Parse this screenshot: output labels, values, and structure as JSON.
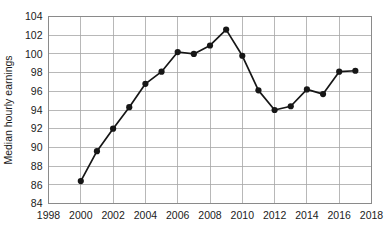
{
  "chart_data": {
    "type": "line",
    "title": "",
    "xlabel": "",
    "ylabel": "Median hourly earnings",
    "xlim": [
      1998,
      2018
    ],
    "ylim": [
      84,
      104
    ],
    "xticks": [
      1998,
      2000,
      2002,
      2004,
      2006,
      2008,
      2010,
      2012,
      2014,
      2016,
      2018
    ],
    "yticks": [
      84,
      86,
      88,
      90,
      92,
      94,
      96,
      98,
      100,
      102,
      104
    ],
    "grid": true,
    "legend": "none",
    "x": [
      2000,
      2001,
      2002,
      2003,
      2004,
      2005,
      2006,
      2007,
      2008,
      2009,
      2010,
      2011,
      2012,
      2013,
      2014,
      2015,
      2016,
      2017
    ],
    "values": [
      86.4,
      89.6,
      92.0,
      94.3,
      96.8,
      98.1,
      100.2,
      100.0,
      100.9,
      102.6,
      99.8,
      96.1,
      94.0,
      94.4,
      96.2,
      95.7,
      98.1,
      98.2
    ],
    "series": [
      {
        "name": "Median hourly earnings",
        "values": [
          86.4,
          89.6,
          92.0,
          94.3,
          96.8,
          98.1,
          100.2,
          100.0,
          100.9,
          102.6,
          99.8,
          96.1,
          94.0,
          94.4,
          96.2,
          95.7,
          98.1,
          98.2
        ],
        "color": "#161616",
        "marker": "circle"
      }
    ],
    "colors": {
      "line": "#161616",
      "marker": "#161616",
      "grid": "#a6a6a6",
      "frame": "#8a8a8a",
      "background": "#ffffff",
      "text": "#1b1b1b"
    }
  }
}
